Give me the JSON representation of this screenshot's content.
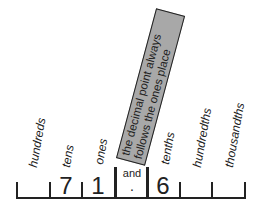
{
  "diagram": {
    "place_labels": [
      "hundreds",
      "tens",
      "ones",
      "tenths",
      "hundredths",
      "thousandths"
    ],
    "digits": {
      "tens": "7",
      "ones": "1",
      "tenths": "6"
    },
    "separator": {
      "word": "and",
      "symbol": "."
    },
    "callout": {
      "line1": "the decimal point always",
      "line2": "follows the ones place"
    },
    "colors": {
      "callout_fill": "#a8a8a8",
      "ink": "#222222"
    }
  }
}
